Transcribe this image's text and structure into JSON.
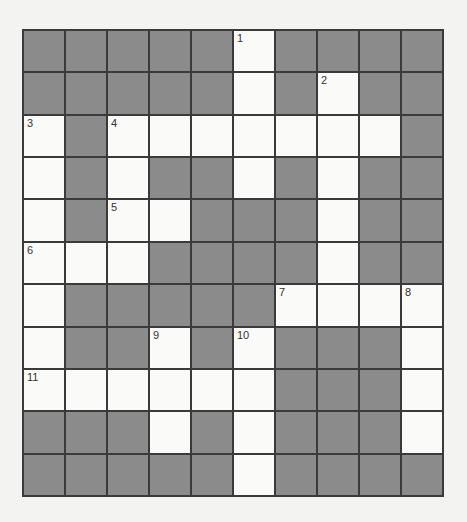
{
  "puzzle": {
    "type": "crossword",
    "rows": 11,
    "cols": 10,
    "colors": {
      "block": "#8b8b8b",
      "open": "#fafaf8",
      "gridline": "#3a3a3a",
      "background": "#f3f3f1"
    },
    "grid": [
      [
        "#",
        "#",
        "#",
        "#",
        "#",
        "1",
        "#",
        "#",
        "#",
        "#"
      ],
      [
        "#",
        "#",
        "#",
        "#",
        "#",
        ".",
        "#",
        "2",
        "#",
        "#"
      ],
      [
        "3",
        "#",
        "4",
        ".",
        ".",
        ".",
        ".",
        ".",
        ".",
        "#"
      ],
      [
        ".",
        "#",
        ".",
        "#",
        "#",
        ".",
        "#",
        ".",
        "#",
        "#"
      ],
      [
        ".",
        "#",
        "5",
        ".",
        "#",
        "#",
        "#",
        ".",
        "#",
        "#"
      ],
      [
        "6",
        ".",
        ".",
        "#",
        "#",
        "#",
        "#",
        ".",
        "#",
        "#"
      ],
      [
        ".",
        "#",
        "#",
        "#",
        "#",
        "#",
        "7",
        ".",
        ".",
        "8"
      ],
      [
        ".",
        "#",
        "#",
        "9",
        "#",
        "10",
        "#",
        "#",
        "#",
        "."
      ],
      [
        "11",
        ".",
        ".",
        ".",
        ".",
        ".",
        "#",
        "#",
        "#",
        "."
      ],
      [
        "#",
        "#",
        "#",
        ".",
        "#",
        ".",
        "#",
        "#",
        "#",
        "."
      ],
      [
        "#",
        "#",
        "#",
        "#",
        "#",
        ".",
        "#",
        "#",
        "#",
        "#"
      ]
    ],
    "legend": {
      "#": "shaded block",
      ".": "empty answer cell",
      "N": "empty answer cell with clue number N"
    }
  }
}
